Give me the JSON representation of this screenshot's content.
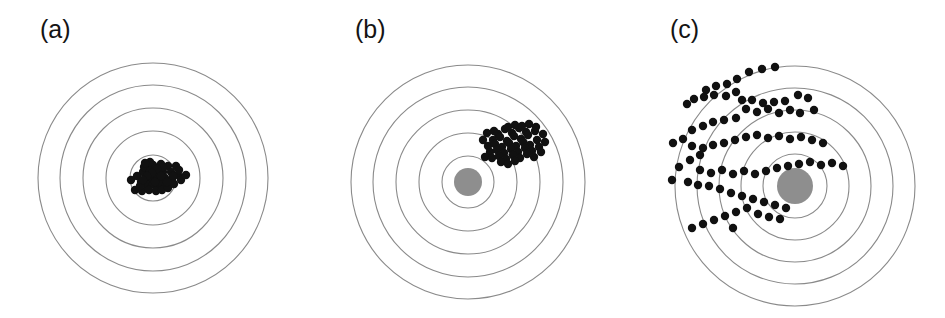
{
  "figure": {
    "width": 945,
    "height": 318,
    "background_color": "#ffffff",
    "ring_color": "#8a8a8a",
    "ring_stroke_width": 1.1,
    "dot_color": "#111111",
    "bullseye_color": "#8e8e8e",
    "dot_radius": 4.2
  },
  "panels": [
    {
      "id": "a",
      "label": "(a)",
      "center_x": 153,
      "center_y": 178,
      "ring_radii": [
        115,
        93,
        70,
        47,
        23
      ],
      "bullseye_radius": 13,
      "bullseye_visible": false,
      "dots": [
        [
          148,
          168
        ],
        [
          153,
          165
        ],
        [
          158,
          169
        ],
        [
          143,
          172
        ],
        [
          150,
          175
        ],
        [
          156,
          174
        ],
        [
          161,
          164
        ],
        [
          146,
          178
        ],
        [
          152,
          180
        ],
        [
          158,
          179
        ],
        [
          163,
          172
        ],
        [
          168,
          166
        ],
        [
          141,
          182
        ],
        [
          147,
          185
        ],
        [
          153,
          184
        ],
        [
          159,
          186
        ],
        [
          165,
          178
        ],
        [
          171,
          172
        ],
        [
          176,
          166
        ],
        [
          137,
          176
        ],
        [
          144,
          167
        ],
        [
          150,
          171
        ],
        [
          155,
          177
        ],
        [
          160,
          182
        ],
        [
          166,
          185
        ],
        [
          172,
          180
        ],
        [
          178,
          175
        ],
        [
          131,
          180
        ],
        [
          135,
          190
        ],
        [
          142,
          191
        ],
        [
          149,
          190
        ],
        [
          156,
          191
        ],
        [
          162,
          190
        ],
        [
          168,
          188
        ],
        [
          174,
          184
        ],
        [
          181,
          180
        ],
        [
          186,
          175
        ],
        [
          150,
          162
        ],
        [
          145,
          163
        ],
        [
          140,
          186
        ],
        [
          163,
          167
        ],
        [
          157,
          169
        ],
        [
          152,
          173
        ],
        [
          147,
          176
        ],
        [
          143,
          180
        ],
        [
          155,
          182
        ],
        [
          161,
          176
        ],
        [
          167,
          182
        ],
        [
          173,
          176
        ],
        [
          179,
          170
        ]
      ]
    },
    {
      "id": "b",
      "label": "(b)",
      "center_x": 468,
      "center_y": 182,
      "ring_radii": [
        117,
        95,
        72,
        49,
        26
      ],
      "bullseye_radius": 14,
      "bullseye_visible": true,
      "dots": [
        [
          498,
          134
        ],
        [
          505,
          129
        ],
        [
          512,
          133
        ],
        [
          519,
          128
        ],
        [
          526,
          132
        ],
        [
          493,
          140
        ],
        [
          500,
          137
        ],
        [
          507,
          141
        ],
        [
          514,
          136
        ],
        [
          521,
          139
        ],
        [
          528,
          135
        ],
        [
          535,
          131
        ],
        [
          488,
          146
        ],
        [
          495,
          144
        ],
        [
          502,
          147
        ],
        [
          509,
          143
        ],
        [
          516,
          146
        ],
        [
          523,
          142
        ],
        [
          530,
          145
        ],
        [
          537,
          140
        ],
        [
          483,
          140
        ],
        [
          490,
          152
        ],
        [
          497,
          150
        ],
        [
          504,
          153
        ],
        [
          511,
          149
        ],
        [
          518,
          152
        ],
        [
          525,
          148
        ],
        [
          532,
          151
        ],
        [
          539,
          147
        ],
        [
          485,
          157
        ],
        [
          492,
          158
        ],
        [
          499,
          156
        ],
        [
          506,
          159
        ],
        [
          513,
          155
        ],
        [
          520,
          158
        ],
        [
          527,
          154
        ],
        [
          534,
          157
        ],
        [
          541,
          152
        ],
        [
          508,
          127
        ],
        [
          515,
          125
        ],
        [
          522,
          126
        ],
        [
          529,
          124
        ],
        [
          536,
          127
        ],
        [
          543,
          134
        ],
        [
          545,
          142
        ],
        [
          487,
          133
        ],
        [
          494,
          131
        ],
        [
          501,
          162
        ],
        [
          508,
          164
        ],
        [
          515,
          161
        ]
      ]
    },
    {
      "id": "c",
      "label": "(c)",
      "center_x": 795,
      "center_y": 186,
      "ring_radii": [
        120,
        98,
        76,
        54,
        32
      ],
      "bullseye_radius": 18,
      "bullseye_visible": true,
      "dots": [
        [
          775,
          67
        ],
        [
          762,
          69
        ],
        [
          749,
          72
        ],
        [
          737,
          79
        ],
        [
          727,
          84
        ],
        [
          716,
          86
        ],
        [
          706,
          90
        ],
        [
          714,
          95
        ],
        [
          704,
          97
        ],
        [
          694,
          99
        ],
        [
          687,
          104
        ],
        [
          726,
          96
        ],
        [
          736,
          92
        ],
        [
          742,
          100
        ],
        [
          752,
          100
        ],
        [
          763,
          103
        ],
        [
          774,
          102
        ],
        [
          785,
          101
        ],
        [
          798,
          95
        ],
        [
          808,
          98
        ],
        [
          746,
          109
        ],
        [
          757,
          112
        ],
        [
          768,
          109
        ],
        [
          779,
          113
        ],
        [
          790,
          110
        ],
        [
          800,
          113
        ],
        [
          814,
          110
        ],
        [
          736,
          118
        ],
        [
          724,
          120
        ],
        [
          713,
          122
        ],
        [
          703,
          126
        ],
        [
          692,
          130
        ],
        [
          683,
          139
        ],
        [
          673,
          143
        ],
        [
          692,
          146
        ],
        [
          703,
          148
        ],
        [
          713,
          145
        ],
        [
          724,
          143
        ],
        [
          735,
          140
        ],
        [
          746,
          137
        ],
        [
          757,
          135
        ],
        [
          768,
          138
        ],
        [
          779,
          136
        ],
        [
          790,
          139
        ],
        [
          801,
          137
        ],
        [
          812,
          140
        ],
        [
          823,
          143
        ],
        [
          700,
          155
        ],
        [
          690,
          160
        ],
        [
          679,
          167
        ],
        [
          700,
          170
        ],
        [
          711,
          173
        ],
        [
          722,
          170
        ],
        [
          733,
          174
        ],
        [
          744,
          171
        ],
        [
          755,
          174
        ],
        [
          766,
          171
        ],
        [
          777,
          168
        ],
        [
          788,
          166
        ],
        [
          799,
          164
        ],
        [
          810,
          162
        ],
        [
          821,
          165
        ],
        [
          832,
          163
        ],
        [
          843,
          166
        ],
        [
          672,
          180
        ],
        [
          688,
          182
        ],
        [
          698,
          185
        ],
        [
          709,
          186
        ],
        [
          720,
          189
        ],
        [
          731,
          193
        ],
        [
          742,
          196
        ],
        [
          753,
          199
        ],
        [
          764,
          202
        ],
        [
          775,
          205
        ],
        [
          786,
          208
        ],
        [
          747,
          208
        ],
        [
          736,
          212
        ],
        [
          725,
          216
        ],
        [
          714,
          220
        ],
        [
          758,
          214
        ],
        [
          769,
          217
        ],
        [
          780,
          219
        ],
        [
          703,
          224
        ],
        [
          692,
          228
        ],
        [
          733,
          228
        ]
      ]
    }
  ]
}
